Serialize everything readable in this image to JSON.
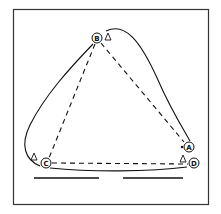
{
  "diagram": {
    "type": "network-route-diagram",
    "frame": {
      "x": 13,
      "y": 9,
      "width": 196,
      "height": 196,
      "stroke": "#333333"
    },
    "nodes": [
      {
        "id": "A",
        "label": "A",
        "x": 189,
        "y": 147
      },
      {
        "id": "B",
        "label": "B",
        "x": 97,
        "y": 38
      },
      {
        "id": "C",
        "label": "C",
        "x": 46,
        "y": 163
      },
      {
        "id": "D",
        "label": "D",
        "x": 194,
        "y": 163
      }
    ],
    "markers": [
      {
        "type": "triangle",
        "near": "B",
        "x": 108,
        "y": 37
      },
      {
        "type": "triangle",
        "near": "D",
        "x": 183,
        "y": 159
      },
      {
        "type": "triangle",
        "near": "C",
        "x": 34,
        "y": 157
      },
      {
        "type": "dot",
        "near": "A",
        "x": 182,
        "y": 147
      }
    ],
    "dashed_edges": [
      {
        "from": "B",
        "to": "A"
      },
      {
        "from": "B",
        "to": "C"
      },
      {
        "from": "C",
        "to": "D"
      }
    ],
    "solid_path": {
      "description": "closed curved loop enclosing triangle B-A-D-C",
      "through": [
        "B",
        "A",
        "D",
        "C"
      ]
    },
    "underlines": [
      {
        "x1": 34,
        "x2": 99,
        "y": 178
      },
      {
        "x1": 123,
        "x2": 183,
        "y": 178
      }
    ],
    "colors": {
      "ink": "#111111",
      "background": "#ffffff",
      "frame": "#333333"
    }
  }
}
